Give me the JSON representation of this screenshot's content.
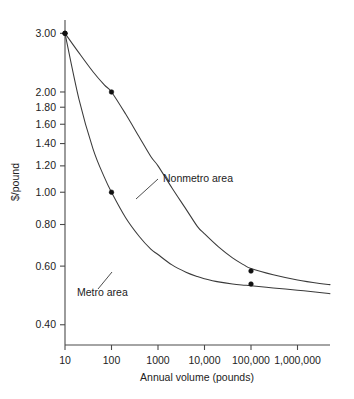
{
  "chart_data": {
    "type": "line",
    "title": "",
    "xlabel": "Annual volume (pounds)",
    "ylabel": "$/pound",
    "xscale": "log",
    "yscale": "log",
    "xlim": [
      10,
      5000000
    ],
    "ylim": [
      0.36,
      3.2
    ],
    "grid": false,
    "legend": "none (inline annotations with leader lines)",
    "xticks": [
      10,
      100,
      1000,
      10000,
      100000,
      1000000
    ],
    "xtick_labels": [
      "10",
      "100",
      "1000",
      "10,000",
      "100,000",
      "1,000,000"
    ],
    "yticks": [
      3.0,
      2.0,
      1.8,
      1.6,
      1.4,
      1.2,
      1.0,
      0.8,
      0.6,
      0.4
    ],
    "ytick_labels": [
      "3.00",
      "2.00",
      "1.80",
      "1.60",
      "1.40",
      "1.20",
      "1.00",
      "0.80",
      "0.60",
      "0.40"
    ],
    "series": [
      {
        "name": "Nonmetro area",
        "annotation": "Nonmetro area",
        "markers": [
          {
            "x": 10,
            "y": 3.0
          },
          {
            "x": 100,
            "y": 2.0
          },
          {
            "x": 100000,
            "y": 0.58
          }
        ],
        "x": [
          10,
          20,
          40,
          70,
          100,
          200,
          400,
          700,
          1000,
          2000,
          4000,
          7000,
          10000,
          20000,
          40000,
          70000,
          100000,
          300000,
          1000000,
          3000000,
          5000000
        ],
        "values": [
          3.0,
          2.62,
          2.3,
          2.1,
          2.0,
          1.72,
          1.46,
          1.28,
          1.2,
          1.03,
          0.89,
          0.79,
          0.75,
          0.685,
          0.635,
          0.605,
          0.59,
          0.565,
          0.545,
          0.532,
          0.528
        ]
      },
      {
        "name": "Metro area",
        "annotation": "Metro area",
        "markers": [
          {
            "x": 10,
            "y": 3.0
          },
          {
            "x": 100,
            "y": 1.0
          },
          {
            "x": 100000,
            "y": 0.53
          }
        ],
        "x": [
          10,
          20,
          40,
          70,
          100,
          200,
          400,
          700,
          1000,
          2000,
          4000,
          7000,
          10000,
          20000,
          40000,
          70000,
          100000,
          300000,
          1000000,
          3000000,
          5000000
        ],
        "values": [
          3.0,
          1.9,
          1.35,
          1.11,
          1.0,
          0.84,
          0.735,
          0.675,
          0.65,
          0.605,
          0.575,
          0.558,
          0.55,
          0.538,
          0.53,
          0.526,
          0.524,
          0.516,
          0.508,
          0.5,
          0.496
        ]
      }
    ],
    "annotations": [
      {
        "text": "Nonmetro area",
        "x_px": 163,
        "y_px": 182
      },
      {
        "text": "Metro area",
        "x_px": 77,
        "y_px": 296
      }
    ],
    "colors": {
      "line": "#3a3a3a",
      "axis": "#4a4a4a",
      "marker": "#111111",
      "background": "#ffffff"
    }
  }
}
